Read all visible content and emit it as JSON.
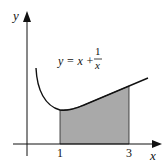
{
  "diagram": {
    "x_axis_label": "x",
    "y_axis_label": "y",
    "equation": {
      "lhs": "y = x +",
      "numerator": "1",
      "denominator": "x"
    },
    "ticks": [
      {
        "label": "1"
      },
      {
        "label": "3"
      }
    ],
    "shaded_region": {
      "from": 1,
      "to": 3,
      "color": "#a9a9a9"
    },
    "curve_color": "#111111"
  }
}
